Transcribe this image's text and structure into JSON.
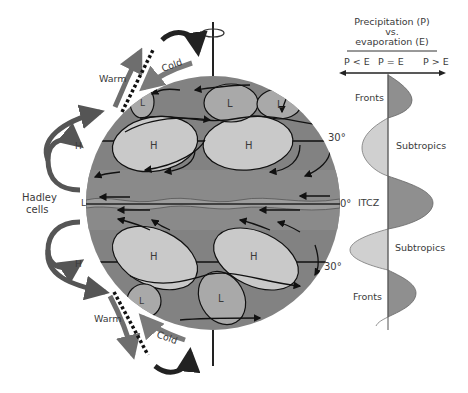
{
  "diagram": {
    "panel_title_line1": "Precipitation (P)",
    "panel_title_line2": "vs.",
    "panel_title_line3": "evaporation (E)",
    "axis_labels": {
      "left": "P < E",
      "center": "P = E",
      "right": "P > E"
    },
    "profile_zones": [
      "Fronts",
      "Subtropics",
      "ITCZ",
      "Subtropics",
      "Fronts"
    ],
    "latitude_labels": {
      "north30": "30°",
      "equator": "0°",
      "south30": "30°"
    },
    "hadley_label_line1": "Hadley",
    "hadley_label_line2": "cells",
    "pressure_labels": {
      "north_H_side": "H",
      "equator_L_side": "L",
      "south_H_side": "H",
      "cells_north": [
        "L",
        "L",
        "L",
        "H",
        "H"
      ],
      "cells_south": [
        "H",
        "H",
        "L",
        "L"
      ]
    },
    "front_labels": {
      "north_warm": "Warm",
      "north_cold": "Cold",
      "south_warm": "Warm",
      "south_cold": "Cold"
    },
    "colors": {
      "globe": "#808080",
      "high_pressure": "#c8c8c8",
      "low_pressure": "#a8a8a8",
      "warm_arrow": "#6e6e6e",
      "cold_arrow": "#7a7a7a",
      "hadley_arrow": "#555555",
      "profile_dry": "#cfcfcf",
      "profile_wet": "#8f8f8f"
    }
  }
}
